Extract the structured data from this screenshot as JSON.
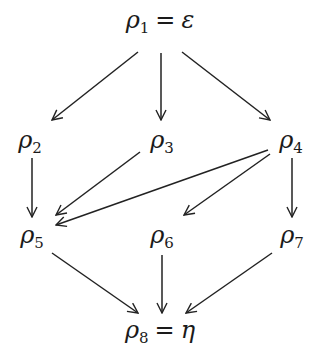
{
  "diagram": {
    "nodes": [
      {
        "id": "rho1",
        "symbol": "ρ",
        "sub": "1",
        "eq": "=",
        "rhs": "ε",
        "x": 160,
        "y": 8
      },
      {
        "id": "rho2",
        "symbol": "ρ",
        "sub": "2",
        "x": 30,
        "y": 128
      },
      {
        "id": "rho3",
        "symbol": "ρ",
        "sub": "3",
        "x": 162,
        "y": 128
      },
      {
        "id": "rho4",
        "symbol": "ρ",
        "sub": "4",
        "x": 291,
        "y": 128
      },
      {
        "id": "rho5",
        "symbol": "ρ",
        "sub": "5",
        "x": 32,
        "y": 223
      },
      {
        "id": "rho6",
        "symbol": "ρ",
        "sub": "6",
        "x": 162,
        "y": 223
      },
      {
        "id": "rho7",
        "symbol": "ρ",
        "sub": "7",
        "x": 292,
        "y": 223
      },
      {
        "id": "rho8",
        "symbol": "ρ",
        "sub": "8",
        "eq": "=",
        "rhs": "η",
        "x": 160,
        "y": 318
      }
    ],
    "edges": [
      {
        "from": "rho1",
        "to": "rho2",
        "x1": 138,
        "y1": 52,
        "x2": 52,
        "y2": 120
      },
      {
        "from": "rho1",
        "to": "rho3",
        "x1": 161,
        "y1": 53,
        "x2": 161,
        "y2": 120
      },
      {
        "from": "rho1",
        "to": "rho4",
        "x1": 182,
        "y1": 52,
        "x2": 270,
        "y2": 120
      },
      {
        "from": "rho2",
        "to": "rho5",
        "x1": 32,
        "y1": 158,
        "x2": 32,
        "y2": 217
      },
      {
        "from": "rho3",
        "to": "rho5",
        "x1": 140,
        "y1": 152,
        "x2": 56,
        "y2": 215
      },
      {
        "from": "rho4",
        "to": "rho5",
        "x1": 268,
        "y1": 150,
        "x2": 56,
        "y2": 225
      },
      {
        "from": "rho4",
        "to": "rho6",
        "x1": 270,
        "y1": 154,
        "x2": 184,
        "y2": 215
      },
      {
        "from": "rho4",
        "to": "rho7",
        "x1": 292,
        "y1": 158,
        "x2": 292,
        "y2": 217
      },
      {
        "from": "rho5",
        "to": "rho8",
        "x1": 52,
        "y1": 253,
        "x2": 138,
        "y2": 313
      },
      {
        "from": "rho6",
        "to": "rho8",
        "x1": 162,
        "y1": 255,
        "x2": 162,
        "y2": 313
      },
      {
        "from": "rho7",
        "to": "rho8",
        "x1": 272,
        "y1": 253,
        "x2": 186,
        "y2": 313
      }
    ]
  },
  "labels": {
    "rho1": {
      "sym": "ρ",
      "sub": "1",
      "eq": "=",
      "rhs": "ε"
    },
    "rho2": {
      "sym": "ρ",
      "sub": "2"
    },
    "rho3": {
      "sym": "ρ",
      "sub": "3"
    },
    "rho4": {
      "sym": "ρ",
      "sub": "4"
    },
    "rho5": {
      "sym": "ρ",
      "sub": "5"
    },
    "rho6": {
      "sym": "ρ",
      "sub": "6"
    },
    "rho7": {
      "sym": "ρ",
      "sub": "7"
    },
    "rho8": {
      "sym": "ρ",
      "sub": "8",
      "eq": "=",
      "rhs": "η"
    }
  }
}
